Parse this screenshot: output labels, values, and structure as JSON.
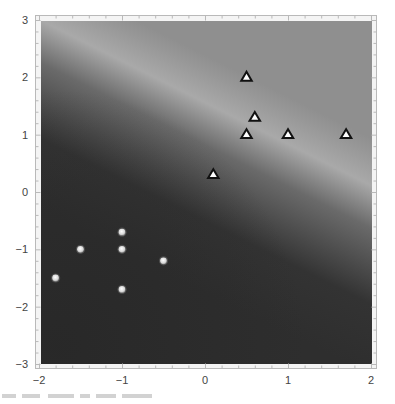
{
  "chart_data": {
    "type": "scatter",
    "title": "",
    "xlabel": "",
    "ylabel": "",
    "xlim": [
      -2,
      2
    ],
    "ylim": [
      -3,
      3
    ],
    "grid": false,
    "legend": null,
    "x_ticks": [
      -2,
      -1,
      0,
      1,
      2
    ],
    "y_ticks": [
      -3,
      -2,
      -1,
      0,
      1,
      2,
      3
    ],
    "x_tick_labels": [
      "−2",
      "−1",
      "0",
      "1",
      "2"
    ],
    "y_tick_labels": [
      "−3",
      "−2",
      "−1",
      "0",
      "1",
      "2",
      "3"
    ],
    "background": {
      "kind": "density / decision-boundary shading",
      "description": "Grayscale field: dark lower-left region, light diagonal band from upper-left (y≈2.7 at x=-2) to lower-right (y≈-0.5 at x=2), medium gray upper-right region",
      "colors": {
        "dark": "#2e2e2e",
        "band": "#a9a9a9",
        "upper": "#8f8f8f"
      }
    },
    "series": [
      {
        "name": "class A",
        "marker": "triangle",
        "marker_fill": "#ffffff",
        "marker_edge": "#111111",
        "points": [
          [
            0.5,
            2.0
          ],
          [
            0.6,
            1.3
          ],
          [
            0.5,
            1.0
          ],
          [
            1.0,
            1.0
          ],
          [
            1.7,
            1.0
          ],
          [
            0.1,
            0.3
          ]
        ]
      },
      {
        "name": "class B",
        "marker": "circle",
        "marker_fill": "#e6e6e6",
        "marker_edge": "none",
        "points": [
          [
            -1.0,
            -0.7
          ],
          [
            -1.5,
            -1.0
          ],
          [
            -1.0,
            -1.0
          ],
          [
            -0.5,
            -1.2
          ],
          [
            -1.8,
            -1.5
          ],
          [
            -1.0,
            -1.7
          ]
        ]
      }
    ]
  }
}
